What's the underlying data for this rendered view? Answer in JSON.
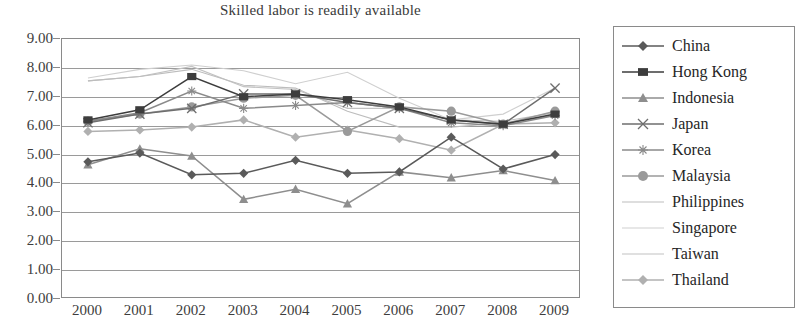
{
  "chart_data": {
    "type": "line",
    "title": "Skilled labor is readily available",
    "xlabel": "",
    "ylabel": "",
    "ylim": [
      0,
      9
    ],
    "ytick_step": 1,
    "grid": true,
    "legend_position": "right",
    "categories": [
      "2000",
      "2001",
      "2002",
      "2003",
      "2004",
      "2005",
      "2006",
      "2007",
      "2008",
      "2009"
    ],
    "ytick_labels": [
      "9.00",
      "8.00",
      "7.00",
      "6.00",
      "5.00",
      "4.00",
      "3.00",
      "2.00",
      "1.00",
      "0.00"
    ],
    "series": [
      {
        "name": "China",
        "marker": "diamond",
        "color": "#5a5a5a",
        "values": [
          4.75,
          5.05,
          4.3,
          4.35,
          4.8,
          4.35,
          4.4,
          5.6,
          4.5,
          5.0
        ]
      },
      {
        "name": "Hong Kong",
        "marker": "square",
        "color": "#3d3d3d",
        "values": [
          6.2,
          6.55,
          7.7,
          7.0,
          7.1,
          6.9,
          6.65,
          6.2,
          6.05,
          6.4
        ]
      },
      {
        "name": "Indonesia",
        "marker": "triangle",
        "color": "#8e8e8e",
        "values": [
          4.65,
          5.2,
          4.95,
          3.45,
          3.8,
          3.3,
          4.4,
          4.2,
          4.45,
          4.1
        ]
      },
      {
        "name": "Japan",
        "marker": "cross",
        "color": "#6e6e6e",
        "values": [
          6.1,
          6.4,
          6.6,
          7.1,
          7.1,
          6.8,
          6.6,
          6.2,
          6.05,
          7.3
        ]
      },
      {
        "name": "Korea",
        "marker": "star",
        "color": "#8a8a8a",
        "values": [
          6.15,
          6.45,
          7.2,
          6.6,
          6.7,
          6.8,
          6.6,
          6.1,
          6.0,
          6.35
        ]
      },
      {
        "name": "Malaysia",
        "marker": "circle",
        "color": "#9a9a9a",
        "values": [
          6.15,
          6.4,
          6.65,
          6.95,
          7.05,
          5.8,
          6.65,
          6.5,
          6.05,
          6.5
        ]
      },
      {
        "name": "Philippines",
        "marker": "none",
        "color": "#bdbdbd",
        "values": [
          7.55,
          7.7,
          7.95,
          7.4,
          7.3,
          6.5,
          5.95,
          5.95,
          6.1,
          6.35
        ]
      },
      {
        "name": "Singapore",
        "marker": "none",
        "color": "#cfcfcf",
        "values": [
          7.65,
          7.95,
          8.1,
          7.9,
          7.45,
          7.85,
          6.95,
          6.2,
          6.4,
          7.3
        ]
      },
      {
        "name": "Taiwan",
        "marker": "none",
        "color": "#c2c2c2",
        "values": [
          7.55,
          7.7,
          8.05,
          7.35,
          7.25,
          6.6,
          6.6,
          6.2,
          6.15,
          6.45
        ]
      },
      {
        "name": "Thailand",
        "marker": "diamond",
        "color": "#b0b0b0",
        "values": [
          5.8,
          5.85,
          5.95,
          6.2,
          5.6,
          5.85,
          5.55,
          5.15,
          6.05,
          6.1
        ]
      }
    ]
  },
  "legend": {
    "items": [
      {
        "label": "China"
      },
      {
        "label": "Hong Kong"
      },
      {
        "label": "Indonesia"
      },
      {
        "label": "Japan"
      },
      {
        "label": "Korea"
      },
      {
        "label": "Malaysia"
      },
      {
        "label": "Philippines"
      },
      {
        "label": "Singapore"
      },
      {
        "label": "Taiwan"
      },
      {
        "label": "Thailand"
      }
    ]
  }
}
